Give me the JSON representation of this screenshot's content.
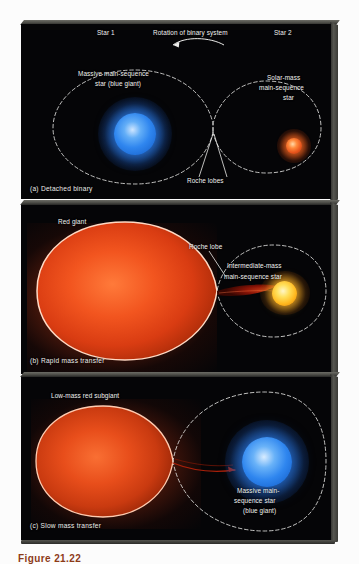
{
  "figure": {
    "caption": "Figure 21.22",
    "panels": [
      {
        "id": "a",
        "caption": "(a)  Detached  binary",
        "labels": {
          "star1": "Star 1",
          "star2": "Star 2",
          "rotation": "Rotation of binary system",
          "left_star_line1": "Massive main-sequence",
          "left_star_line2": "star (blue giant)",
          "right_star_line1": "Solar-mass",
          "right_star_line2": "main-sequence",
          "right_star_line3": "star",
          "roche": "Roche lobes"
        },
        "colors": {
          "left_star": "#2f86ef",
          "left_star_glow": "#1d4f9c",
          "right_star": "#e8551c",
          "right_star_glow": "#7a2408",
          "lobe_line": "#e9e9e6",
          "background": "#050507"
        }
      },
      {
        "id": "b",
        "caption": "(b)  Rapid mass  transfer",
        "labels": {
          "red_giant": "Red giant",
          "roche": "Roche lobe",
          "companion_line1": "Intermediate-mass",
          "companion_line2": "main-sequence star"
        },
        "colors": {
          "giant": "#e8431a",
          "giant_rim": "#ffd9c4",
          "companion": "#ffd23c",
          "companion_glow": "#c06a10",
          "stream": "#8e1406",
          "lobe_line": "#e9e9e6",
          "background": "#050507"
        }
      },
      {
        "id": "c",
        "caption": "(c)  Slow mass  transfer",
        "labels": {
          "subgiant": "Low-mass red subgiant",
          "companion_line1": "Massive main-",
          "companion_line2": "sequence star",
          "companion_line3": "(blue giant)"
        },
        "colors": {
          "subgiant": "#e2401a",
          "subgiant_rim": "#ffcbb0",
          "companion": "#2f86ef",
          "companion_glow": "#1d4f9c",
          "stream_arrow": "#a01a08",
          "lobe_line": "#e9e9e6",
          "background": "#050507"
        }
      }
    ]
  }
}
